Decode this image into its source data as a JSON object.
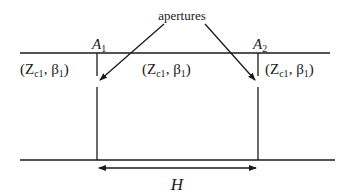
{
  "diagram": {
    "callout": {
      "label": "apertures"
    },
    "apertures": [
      {
        "id": "A1",
        "name": "A",
        "subscript": "1"
      },
      {
        "id": "A2",
        "name": "A",
        "subscript": "2"
      }
    ],
    "regions": [
      {
        "z": "Z",
        "z_sub": "c1",
        "beta": "β",
        "beta_sub": "1"
      },
      {
        "z": "Z",
        "z_sub": "c1",
        "beta": "β",
        "beta_sub": "1"
      },
      {
        "z": "Z",
        "z_sub": "c1",
        "beta": "β",
        "beta_sub": "1"
      }
    ],
    "dimension": {
      "label": "H"
    }
  }
}
